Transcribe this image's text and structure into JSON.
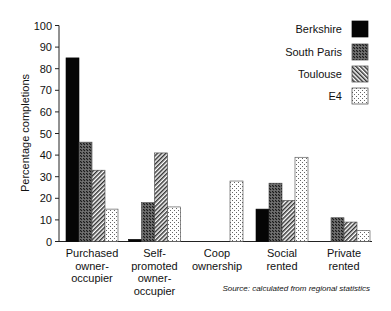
{
  "chart_data": {
    "type": "bar",
    "title": "",
    "xlabel": "",
    "ylabel": "Percentage completions",
    "ylim": [
      0,
      100
    ],
    "yticks": [
      0,
      10,
      20,
      30,
      40,
      50,
      60,
      70,
      80,
      90,
      100
    ],
    "grid": false,
    "legend_position": "top-right",
    "categories": [
      [
        "Purchased",
        "owner-",
        "occupier"
      ],
      [
        "Self-",
        "promoted",
        "owner-",
        "occupier"
      ],
      [
        "Coop",
        "ownership"
      ],
      [
        "Social",
        "rented"
      ],
      [
        "Private",
        "rented"
      ]
    ],
    "category_names": [
      "Purchased owner-occupier",
      "Self-promoted owner-occupier",
      "Coop ownership",
      "Social rented",
      "Private rented"
    ],
    "series": [
      {
        "name": "Berkshire",
        "pattern": "solid",
        "values": [
          85,
          1,
          0,
          15,
          0
        ]
      },
      {
        "name": "South Paris",
        "pattern": "checker",
        "values": [
          46,
          18,
          0,
          27,
          11
        ]
      },
      {
        "name": "Toulouse",
        "pattern": "hatch",
        "values": [
          33,
          41,
          0,
          19,
          9
        ]
      },
      {
        "name": "E4",
        "pattern": "dots",
        "values": [
          15,
          16,
          28,
          39,
          5
        ]
      }
    ],
    "annotations": [
      "Source: calculated from regional statistics"
    ]
  },
  "colors": {
    "axis": "#222222",
    "solid": "#050505",
    "pattern_dark": "#1a1a1a",
    "pattern_light": "#ffffff"
  }
}
